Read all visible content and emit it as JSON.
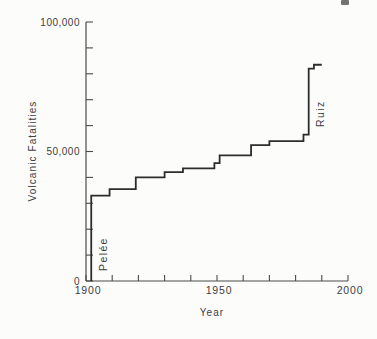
{
  "figure": {
    "kind": "scanned-book-step-chart"
  },
  "chart_data": {
    "type": "line",
    "subtype": "cumulative-step",
    "title": "",
    "xlabel": "Year",
    "ylabel": "Volcanic Fatalities",
    "x_range": [
      1900,
      2000
    ],
    "y_range": [
      0,
      100000
    ],
    "x_tick_interval": 10,
    "y_tick_interval": 10000,
    "grid": false,
    "legend": "none",
    "x_tick_labels": [
      {
        "value": 1900,
        "label": "1900"
      },
      {
        "value": 1950,
        "label": "1950"
      },
      {
        "value": 2000,
        "label": "2000"
      }
    ],
    "y_tick_labels": [
      {
        "value": 0,
        "label": "0"
      },
      {
        "value": 50000,
        "label": "50,000"
      },
      {
        "value": 100000,
        "label": "100,000"
      }
    ],
    "series": [
      {
        "name": "Cumulative volcanic fatalities since 1900",
        "start": {
          "year": 1902,
          "value": 0
        },
        "end_year": 1990,
        "events": [
          {
            "year": 1902,
            "cumulative": 33000,
            "label": "Pelée"
          },
          {
            "year": 1909,
            "cumulative": 35500
          },
          {
            "year": 1919,
            "cumulative": 40000
          },
          {
            "year": 1930,
            "cumulative": 42000
          },
          {
            "year": 1937,
            "cumulative": 43500
          },
          {
            "year": 1949,
            "cumulative": 45500
          },
          {
            "year": 1951,
            "cumulative": 48500
          },
          {
            "year": 1963,
            "cumulative": 52500
          },
          {
            "year": 1970,
            "cumulative": 54000
          },
          {
            "year": 1983,
            "cumulative": 56500
          },
          {
            "year": 1985,
            "cumulative": 82000,
            "label": "Ruiz"
          },
          {
            "year": 1987,
            "cumulative": 83500
          }
        ]
      }
    ],
    "annotations": [
      {
        "text": "Pelée",
        "x": 107,
        "y": 271,
        "rotation": -90
      },
      {
        "text": "Ruiz",
        "x": 324,
        "y": 127,
        "rotation": -90
      }
    ],
    "colors": {
      "line": "#2d2d2d",
      "axis": "#4b4b4b",
      "text": "#3d3d3d",
      "background": "#fcfcfb"
    },
    "plot_area": {
      "left": 86,
      "top": 22,
      "right": 348,
      "bottom": 281
    },
    "layout": {
      "ylabel_pos": {
        "x": 36,
        "y": 151
      },
      "xlabel_pos": {
        "x": 212,
        "y": 316
      },
      "y_tick_len": 7,
      "x_tick_len": 6
    }
  }
}
